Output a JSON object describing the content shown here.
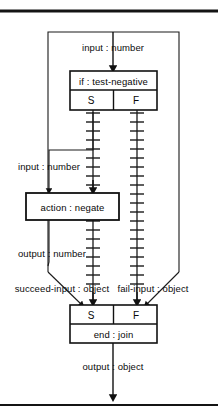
{
  "diagram": {
    "type": "flowchart",
    "background_color": "#ffffff",
    "line_color": "#111111",
    "rules": [
      {
        "name": "top-rule",
        "y": 11,
        "thickness": 3
      },
      {
        "name": "bottom-rule",
        "y": 405,
        "thickness": 2
      }
    ],
    "frame": {
      "x": 48,
      "y": 32,
      "width": 131,
      "height": 330
    },
    "nodes": [
      {
        "id": "if-node",
        "header": "if : test-negative",
        "ports": [
          "S",
          "F"
        ],
        "x": 70,
        "y": 71,
        "width": 87,
        "height": 39
      },
      {
        "id": "action-node",
        "header": "action : negate",
        "ports": [],
        "x": 26,
        "y": 193,
        "width": 93,
        "height": 27
      },
      {
        "id": "end-node",
        "header": "end : join",
        "ports": [
          "S",
          "F"
        ],
        "x": 70,
        "y": 305,
        "width": 87,
        "height": 38
      }
    ],
    "edge_labels": [
      {
        "id": "if-input",
        "text": "input : number",
        "x": 113,
        "y": 47
      },
      {
        "id": "action-input",
        "text": "input : number",
        "x": 49,
        "y": 166
      },
      {
        "id": "action-output",
        "text": "output : number",
        "x": 52,
        "y": 253
      },
      {
        "id": "succeed-input",
        "text": "succeed-input : object",
        "x": 62,
        "y": 288
      },
      {
        "id": "fail-input",
        "text": "fail-input : object",
        "x": 153,
        "y": 288
      },
      {
        "id": "end-output",
        "text": "output : object",
        "x": 113,
        "y": 366
      }
    ],
    "hatched_channels": [
      {
        "id": "succeed-channel",
        "x": 93,
        "y_start": 110,
        "y_end": 300,
        "tick_spacing": 9,
        "tick_half_width": 7
      },
      {
        "id": "fail-channel",
        "x": 137,
        "y_start": 110,
        "y_end": 300,
        "tick_spacing": 9,
        "tick_half_width": 7
      }
    ]
  }
}
